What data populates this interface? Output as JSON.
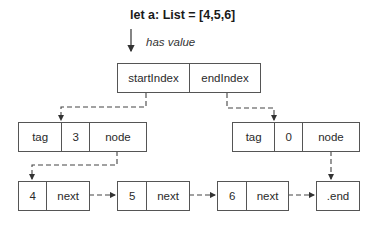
{
  "header": {
    "declaration": "let a: List = [4,5,6]",
    "relation_label": "has value"
  },
  "list_struct": {
    "fields": [
      "startIndex",
      "endIndex"
    ]
  },
  "index_nodes": [
    {
      "cells": [
        "tag",
        "3",
        "node"
      ]
    },
    {
      "cells": [
        "tag",
        "0",
        "node"
      ]
    }
  ],
  "linked_nodes": [
    {
      "cells": [
        "4",
        "next"
      ]
    },
    {
      "cells": [
        "5",
        "next"
      ]
    },
    {
      "cells": [
        "6",
        "next"
      ]
    },
    {
      "cells": [
        ".end"
      ]
    }
  ],
  "colors": {
    "stroke": "#555555",
    "arrow": "#333333",
    "background": "#ffffff"
  }
}
